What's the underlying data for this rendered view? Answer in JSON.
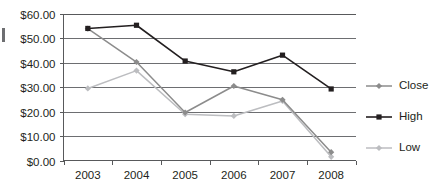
{
  "chart_data": {
    "type": "line",
    "title": "",
    "xlabel": "",
    "ylabel": "",
    "categories": [
      "2003",
      "2004",
      "2005",
      "2006",
      "2007",
      "2008"
    ],
    "ylim": [
      0,
      60
    ],
    "y_tick_values": [
      0,
      10,
      20,
      30,
      40,
      50,
      60
    ],
    "y_tick_labels": [
      "$0.00",
      "$10.00",
      "$20.00",
      "$30.00",
      "$40.00",
      "$50.00",
      "$60.00"
    ],
    "grid": "horizontal",
    "legend_position": "right",
    "series": [
      {
        "name": "Close",
        "color": "#8c8c8c",
        "marker": "diamond",
        "values": [
          53.8,
          40.2,
          19.6,
          30.4,
          24.8,
          3.4
        ]
      },
      {
        "name": "High",
        "color": "#231f20",
        "marker": "square",
        "values": [
          53.9,
          55.2,
          40.6,
          36.2,
          43.0,
          29.2
        ]
      },
      {
        "name": "Low",
        "color": "#bcbdc0",
        "marker": "diamond",
        "values": [
          29.4,
          36.7,
          18.9,
          18.2,
          24.3,
          1.5
        ]
      }
    ]
  },
  "legend": {
    "entries": [
      {
        "label": "Close"
      },
      {
        "label": "High"
      },
      {
        "label": "Low"
      }
    ]
  }
}
